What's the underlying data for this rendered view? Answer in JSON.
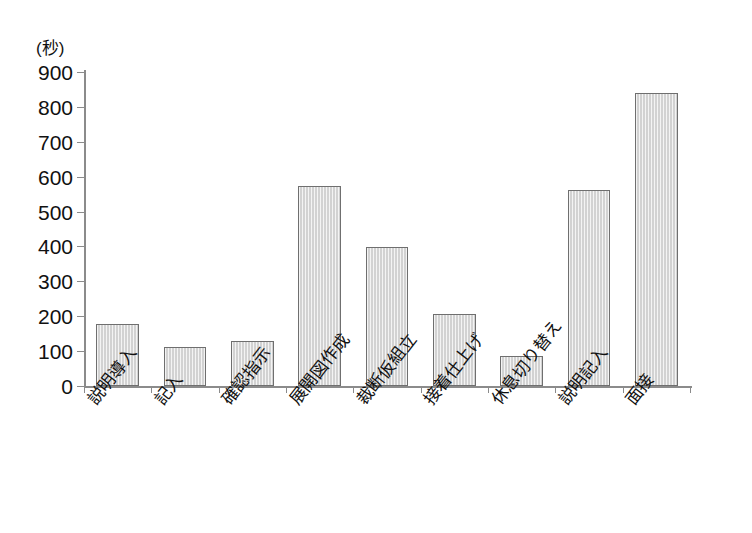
{
  "chart_data": {
    "type": "bar",
    "title": "",
    "subtitle": "",
    "xlabel": "",
    "ylabel": "(秒)",
    "ylim": [
      0,
      900
    ],
    "ytick_step": 100,
    "ytick_labels": [
      "900",
      "800",
      "700",
      "600",
      "500",
      "400",
      "300",
      "200",
      "100",
      "0"
    ],
    "ytick_values": [
      900,
      800,
      700,
      600,
      500,
      400,
      300,
      200,
      100,
      0
    ],
    "grid": false,
    "legend": null,
    "legend_position": "none",
    "categories": [
      "説明導入",
      "記入",
      "確認指示",
      "展開図作成",
      "裁断仮組立",
      "接着仕上げ",
      "休息切り替え",
      "説明記入",
      "面接"
    ],
    "values": [
      178,
      113,
      130,
      573,
      398,
      205,
      85,
      562,
      840
    ],
    "annotations": [],
    "style": {
      "bar_fill": "#d2d2d2",
      "bar_border": "#6f6f6f",
      "axis_color": "#8b8b8b",
      "text_color": "#111111",
      "background": "#ffffff"
    }
  }
}
